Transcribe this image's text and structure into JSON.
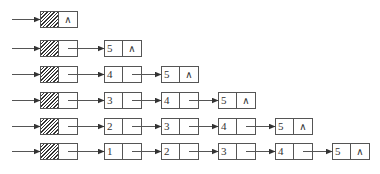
{
  "colors": {
    "line": "#555555",
    "hatch": "#333333",
    "background": "#ffffff"
  },
  "null_symbol": "∧",
  "layout": {
    "row_tops": [
      11,
      40,
      66,
      92,
      118,
      143
    ],
    "head_x": 40,
    "node_xs": [
      104,
      161,
      218,
      275,
      332
    ],
    "node_width": 38,
    "node_height": 17
  },
  "rows": [
    {
      "values": []
    },
    {
      "values": [
        "5"
      ]
    },
    {
      "values": [
        "4",
        "5"
      ]
    },
    {
      "values": [
        "3",
        "4",
        "5"
      ]
    },
    {
      "values": [
        "2",
        "3",
        "4",
        "5"
      ]
    },
    {
      "values": [
        "1",
        "2",
        "3",
        "4",
        "5"
      ]
    }
  ]
}
